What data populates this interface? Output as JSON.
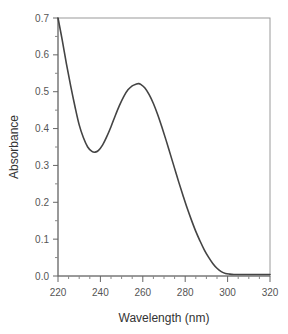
{
  "chart_data": {
    "type": "line",
    "title": "",
    "xlabel": "Wavelength (nm)",
    "ylabel": "Absorbance",
    "xlim": [
      220,
      320
    ],
    "ylim": [
      0.0,
      0.7
    ],
    "xticks": [
      220,
      240,
      260,
      280,
      300,
      320
    ],
    "xtick_labels": [
      "220",
      "240",
      "260",
      "280",
      "300",
      "320"
    ],
    "yticks": [
      0.0,
      0.1,
      0.2,
      0.3,
      0.4,
      0.5,
      0.6,
      0.7
    ],
    "ytick_labels": [
      "0.0",
      "0.1",
      "0.2",
      "0.3",
      "0.4",
      "0.5",
      "0.6",
      "0.7"
    ],
    "grid": false,
    "legend": null,
    "series": [
      {
        "name": "UV absorbance spectrum",
        "color": "#444444",
        "x": [
          220,
          222,
          224,
          226,
          228,
          230,
          232,
          234,
          236,
          237.5,
          239,
          241,
          243,
          245,
          247,
          249,
          251,
          253,
          255,
          257,
          258,
          259,
          261,
          263,
          265,
          267,
          269,
          271,
          273,
          275,
          277,
          279,
          281,
          283,
          285,
          287,
          289,
          291,
          293,
          295,
          297,
          299,
          301,
          303,
          305,
          307,
          310,
          315,
          320
        ],
        "values": [
          0.7,
          0.64,
          0.575,
          0.515,
          0.46,
          0.41,
          0.375,
          0.35,
          0.338,
          0.336,
          0.34,
          0.355,
          0.378,
          0.405,
          0.435,
          0.463,
          0.487,
          0.505,
          0.516,
          0.521,
          0.522,
          0.52,
          0.51,
          0.492,
          0.468,
          0.438,
          0.404,
          0.368,
          0.33,
          0.292,
          0.254,
          0.218,
          0.183,
          0.151,
          0.121,
          0.095,
          0.071,
          0.051,
          0.034,
          0.021,
          0.012,
          0.007,
          0.005,
          0.004,
          0.004,
          0.004,
          0.004,
          0.004,
          0.004
        ]
      }
    ],
    "annotations": {
      "peak": {
        "x": 258,
        "y": 0.52
      },
      "minimum": {
        "x": 237.5,
        "y": 0.336
      }
    }
  }
}
